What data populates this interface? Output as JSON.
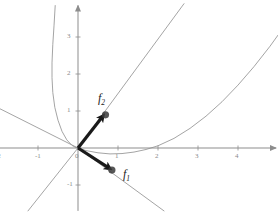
{
  "figure": {
    "kind": "vector-field-plot",
    "background_color": "#ffffff",
    "axis_color": "#8d8d8d",
    "curve_color": "#9a9a9a",
    "vector_color": "#1a1a1a",
    "tick_label_color": "#8a8a8a"
  },
  "axes": {
    "x_axis_name": "x-axis",
    "y_axis_name": "y-axis",
    "origin_px": {
      "x": 78,
      "y": 148
    },
    "unit_px": {
      "x": 40,
      "y": 37
    },
    "x_ticks": [
      {
        "value": -2,
        "label": "-2"
      },
      {
        "value": -1,
        "label": "-1"
      },
      {
        "value": 0,
        "label": "0"
      },
      {
        "value": 1,
        "label": "1"
      },
      {
        "value": 2,
        "label": "2"
      },
      {
        "value": 3,
        "label": "3"
      },
      {
        "value": 4,
        "label": "4"
      }
    ],
    "y_ticks": [
      {
        "value": -1,
        "label": "-1"
      },
      {
        "value": 1,
        "label": "1"
      },
      {
        "value": 2,
        "label": "2"
      },
      {
        "value": 3,
        "label": "3"
      }
    ],
    "xlim": [
      -2.3,
      5.0
    ],
    "ylim": [
      -1.7,
      3.9
    ],
    "grid": false
  },
  "chart_data": {
    "type": "line",
    "title": "",
    "xlabel": "",
    "ylabel": "",
    "xlim": [
      -2.3,
      5.0
    ],
    "ylim": [
      -1.7,
      3.9
    ],
    "grid": false,
    "legend": "none",
    "curves": [
      {
        "name": "narrow-upward-parabola",
        "description": "steep parabola through origin opening upward, leaning left",
        "color": "#9a9a9a",
        "points": [
          [
            -0.57,
            3.85
          ],
          [
            -0.6,
            3.3
          ],
          [
            -0.63,
            2.8
          ],
          [
            -0.65,
            2.3
          ],
          [
            -0.65,
            1.9
          ],
          [
            -0.63,
            1.5
          ],
          [
            -0.58,
            1.1
          ],
          [
            -0.5,
            0.75
          ],
          [
            -0.4,
            0.45
          ],
          [
            -0.28,
            0.22
          ],
          [
            -0.15,
            0.07
          ],
          [
            -0.05,
            0.01
          ],
          [
            0.0,
            0.0
          ]
        ]
      },
      {
        "name": "wide-upward-parabola",
        "description": "broad parabola with vertex near (1, -0.15) crossing x-axis near x=2",
        "color": "#9a9a9a",
        "points": [
          [
            -0.05,
            0.02
          ],
          [
            0.2,
            -0.07
          ],
          [
            0.5,
            -0.13
          ],
          [
            0.8,
            -0.16
          ],
          [
            1.1,
            -0.15
          ],
          [
            1.4,
            -0.11
          ],
          [
            1.7,
            -0.04
          ],
          [
            2.0,
            0.06
          ],
          [
            2.4,
            0.26
          ],
          [
            2.8,
            0.53
          ],
          [
            3.2,
            0.86
          ],
          [
            3.6,
            1.25
          ],
          [
            4.0,
            1.7
          ],
          [
            4.4,
            2.2
          ],
          [
            4.8,
            2.75
          ],
          [
            5.0,
            3.05
          ]
        ]
      },
      {
        "name": "line-up-right",
        "description": "straight line through origin with positive slope toward upper right",
        "color": "#9a9a9a",
        "points": [
          [
            0.0,
            0.0
          ],
          [
            2.65,
            3.9
          ]
        ]
      },
      {
        "name": "line-up-left",
        "description": "straight line through origin with negative slope toward upper left",
        "color": "#9a9a9a",
        "points": [
          [
            0.0,
            0.0
          ],
          [
            -2.3,
            1.25
          ]
        ]
      },
      {
        "name": "line-down-left",
        "description": "straight line through origin with positive slope toward lower left",
        "color": "#9a9a9a",
        "points": [
          [
            0.0,
            0.0
          ],
          [
            -1.25,
            -1.7
          ]
        ]
      },
      {
        "name": "line-down-right",
        "description": "straight line through origin with negative slope toward lower right",
        "color": "#9a9a9a",
        "points": [
          [
            0.0,
            0.0
          ],
          [
            2.15,
            -1.7
          ]
        ]
      }
    ],
    "vectors": [
      {
        "name": "f1",
        "label": "f",
        "subscript": "1",
        "tail": [
          0.0,
          0.0
        ],
        "tip": [
          0.76,
          -0.53
        ],
        "color": "#1a1a1a",
        "label_px": {
          "x": 123,
          "y": 168
        }
      },
      {
        "name": "f2",
        "label": "f",
        "subscript": "2",
        "tail": [
          0.0,
          0.0
        ],
        "tip": [
          0.6,
          0.83
        ],
        "color": "#1a1a1a",
        "label_px": {
          "x": 98,
          "y": 92
        }
      }
    ]
  },
  "labels": {
    "f1": {
      "base": "f",
      "sub": "1"
    },
    "f2": {
      "base": "f",
      "sub": "2"
    }
  }
}
